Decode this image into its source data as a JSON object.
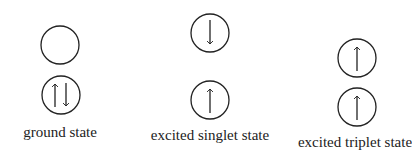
{
  "diagram": {
    "type": "electron-spin-states",
    "states": [
      {
        "label": "ground state",
        "orbitals": [
          {
            "position": "upper",
            "electrons": []
          },
          {
            "position": "lower",
            "electrons": [
              "up",
              "down"
            ]
          }
        ]
      },
      {
        "label": "excited singlet state",
        "orbitals": [
          {
            "position": "upper",
            "electrons": [
              "down"
            ]
          },
          {
            "position": "lower",
            "electrons": [
              "up"
            ]
          }
        ]
      },
      {
        "label": "excited triplet state",
        "orbitals": [
          {
            "position": "upper",
            "electrons": [
              "up"
            ]
          },
          {
            "position": "lower",
            "electrons": [
              "up"
            ]
          }
        ]
      }
    ],
    "colors": {
      "stroke": "#222222",
      "background": "#ffffff"
    }
  }
}
